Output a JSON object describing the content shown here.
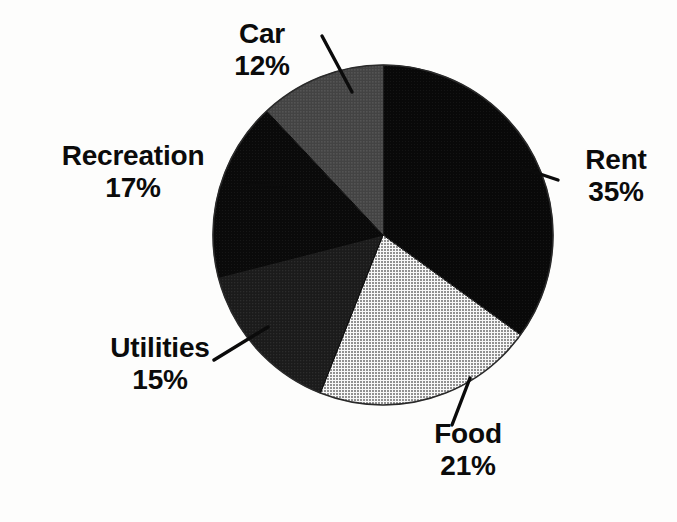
{
  "figure": {
    "background_color": "#fdfdfc",
    "text_color": "#0b0b0b",
    "center_x": 383,
    "center_y": 235,
    "radius": 170
  },
  "chart_data": {
    "type": "pie",
    "title": "",
    "subtitle": "",
    "xlabel": "",
    "ylabel": "",
    "grid": false,
    "legend_position": "none",
    "label_format": "name + percent, placed outside with leader lines",
    "start_angle_deg": 0,
    "direction": "clockwise",
    "units": "percent",
    "total": 100,
    "categories": [
      "Rent",
      "Food",
      "Utilities",
      "Recreation",
      "Car"
    ],
    "values": [
      35,
      21,
      15,
      17,
      12
    ],
    "slices": [
      {
        "name": "Rent",
        "value": 35,
        "value_label": "35%",
        "color": "#0a0a0a",
        "start_angle_deg": 0,
        "end_angle_deg": 126,
        "label_side": "right"
      },
      {
        "name": "Food",
        "value": 21,
        "value_label": "21%",
        "color": "#a9a9a9",
        "start_angle_deg": 126,
        "end_angle_deg": 201.6,
        "label_side": "bottom"
      },
      {
        "name": "Utilities",
        "value": 15,
        "value_label": "15%",
        "color": "#232323",
        "start_angle_deg": 201.6,
        "end_angle_deg": 255.6,
        "label_side": "bottom-left"
      },
      {
        "name": "Recreation",
        "value": 17,
        "value_label": "17%",
        "color": "#0d0d0d",
        "start_angle_deg": 255.6,
        "end_angle_deg": 316.8,
        "label_side": "left"
      },
      {
        "name": "Car",
        "value": 12,
        "value_label": "12%",
        "color": "#4a4a4a",
        "start_angle_deg": 316.8,
        "end_angle_deg": 360,
        "label_side": "top-left"
      }
    ]
  },
  "labels": {
    "car": {
      "name": "Car",
      "value": "12%"
    },
    "recreation": {
      "name": "Recreation",
      "value": "17%"
    },
    "utilities": {
      "name": "Utilities",
      "value": "15%"
    },
    "rent": {
      "name": "Rent",
      "value": "35%"
    },
    "food": {
      "name": "Food",
      "value": "21%"
    }
  }
}
